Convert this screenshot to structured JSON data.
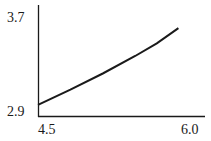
{
  "chart_data": {
    "type": "line",
    "title": "",
    "xlabel": "",
    "ylabel": "",
    "xlim": [
      4.5,
      6.0
    ],
    "ylim": [
      2.9,
      3.7
    ],
    "x_ticks": [
      "4.5",
      "6.0"
    ],
    "y_ticks": [
      "2.9",
      "3.7"
    ],
    "grid": false,
    "legend": null,
    "series": [
      {
        "name": "curve",
        "color": "#1a1a1a",
        "x": [
          4.5,
          4.8,
          5.1,
          5.4,
          5.6,
          5.8
        ],
        "y": [
          2.97,
          3.1,
          3.24,
          3.39,
          3.5,
          3.63
        ]
      }
    ]
  },
  "axis_labels": {
    "y_top": "3.7",
    "y_bottom": "2.9",
    "x_left": "4.5",
    "x_right": "6.0"
  }
}
